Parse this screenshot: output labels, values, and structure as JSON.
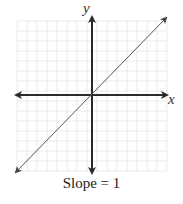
{
  "chart_data": {
    "type": "line",
    "title": "",
    "caption": "Slope = 1",
    "xlabel": "x",
    "ylabel": "y",
    "grid": true,
    "axis_ticks_labeled": false,
    "series": [
      {
        "name": "y = x",
        "slope": 1,
        "intercept": 0,
        "x": [
          -7.5,
          7.5
        ],
        "y": [
          -7.5,
          7.5
        ]
      }
    ],
    "xlim": [
      -7.5,
      7.5
    ],
    "ylim": [
      -7.5,
      7.5
    ]
  },
  "labels": {
    "x_axis": "x",
    "y_axis": "y",
    "caption": "Slope = 1"
  },
  "colors": {
    "grid": "#e6e6e6",
    "axis": "#2a2a2a",
    "line": "#555555",
    "text": "#222222"
  }
}
